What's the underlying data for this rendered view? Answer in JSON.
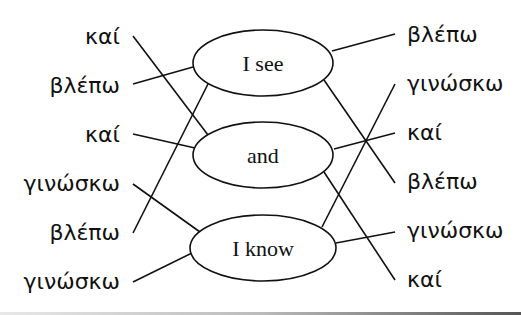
{
  "diagram": {
    "type": "matching-exercise",
    "center_nodes": [
      {
        "id": "see",
        "label": "I see"
      },
      {
        "id": "and",
        "label": "and"
      },
      {
        "id": "know",
        "label": "I know"
      }
    ],
    "left_words": [
      {
        "label": "καί",
        "connects_to": "and"
      },
      {
        "label": "βλέπω",
        "connects_to": "see"
      },
      {
        "label": "καί",
        "connects_to": "and"
      },
      {
        "label": "γινώσκω",
        "connects_to": "know"
      },
      {
        "label": "βλέπω",
        "connects_to": "see"
      },
      {
        "label": "γινώσκω",
        "connects_to": "know"
      }
    ],
    "right_words": [
      {
        "label": "βλέπω",
        "connects_to": "see"
      },
      {
        "label": "γινώσκω",
        "connects_to": "know"
      },
      {
        "label": "καί",
        "connects_to": "and"
      },
      {
        "label": "βλέπω",
        "connects_to": "see"
      },
      {
        "label": "γινώσκω",
        "connects_to": "know"
      },
      {
        "label": "καί",
        "connects_to": "and"
      }
    ]
  }
}
